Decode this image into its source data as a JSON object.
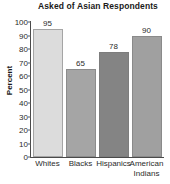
{
  "chart_data": {
    "type": "bar",
    "title": "Asked of Asian Respondents",
    "xlabel": "",
    "ylabel": "Percent",
    "categories": [
      "Whites",
      "Blacks",
      "Hispanics",
      "American Indians"
    ],
    "values": [
      95,
      65,
      78,
      90
    ],
    "value_labels": [
      "95",
      "65",
      "78",
      "90"
    ],
    "ylim": [
      0,
      100
    ],
    "ytick_labels": [
      "0",
      "10",
      "20",
      "30",
      "40",
      "50",
      "60",
      "70",
      "80",
      "90",
      "100"
    ],
    "ytick_values": [
      0,
      10,
      20,
      30,
      40,
      50,
      60,
      70,
      80,
      90,
      100
    ],
    "grid": false,
    "legend": false,
    "bar_colors": [
      "#dcdcdc",
      "#a5a5a5",
      "#848484",
      "#a0a0a0"
    ],
    "axis_color": "#4a4a4a",
    "text_color": "#2b2b2b",
    "background": "#ffffff"
  }
}
